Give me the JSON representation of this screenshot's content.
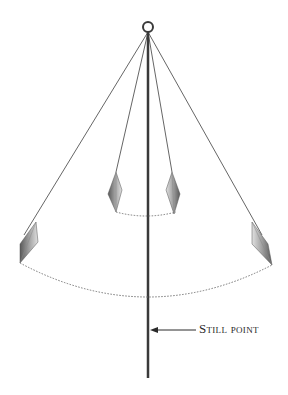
{
  "diagram": {
    "type": "pendulum-swing-illustration",
    "annotation": {
      "label": "Still point",
      "arrow_direction": "left"
    },
    "elements": {
      "suspension_ring": "ring-icon",
      "center_rod": "vertical-rod",
      "pendulums": [
        {
          "name": "inner-left-pendulum"
        },
        {
          "name": "inner-right-pendulum"
        },
        {
          "name": "outer-left-pendulum"
        },
        {
          "name": "outer-right-pendulum"
        }
      ],
      "arcs": [
        {
          "name": "small-swing-arc",
          "style": "dotted"
        },
        {
          "name": "large-swing-arc",
          "style": "dotted"
        }
      ]
    },
    "colors": {
      "line": "#555555",
      "rod": "#3a3a3a",
      "crystal_dark": "#4a4a4a",
      "crystal_light": "#c8c8c8",
      "arc": "#777777",
      "text": "#2a2a2a"
    }
  }
}
